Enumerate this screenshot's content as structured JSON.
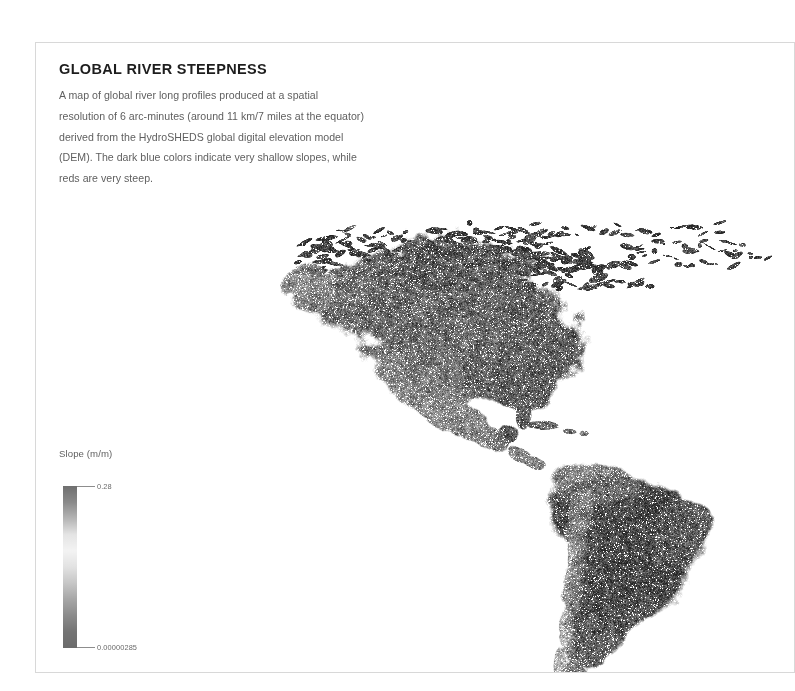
{
  "card": {
    "title": "GLOBAL RIVER STEEPNESS",
    "description": "A map of global river long profiles produced at a spatial resolution of 6 arc-minutes (around 11 km/7 miles at the equator) derived from the HydroSHEDS global digital elevation model (DEM). The dark blue colors indicate very shallow slopes, while reds are very steep.",
    "border_color": "#d8d8d8",
    "background_color": "#ffffff",
    "title_color": "#1d1d1d",
    "text_color": "#5f5f5f"
  },
  "legend": {
    "title": "Slope (m/m)",
    "max_label": "0.28",
    "min_label": "0.00000285",
    "orientation": "vertical",
    "gradient_stops": [
      "#6f6f6f",
      "#8a8a8a",
      "#b4b4b4",
      "#e4e4e4",
      "#f3f3f3",
      "#e2e2e2",
      "#c6c6c6",
      "#a6a6a6",
      "#8b8b8b",
      "#747474",
      "#6b6b6b"
    ],
    "tick_color": "#8d8d8d",
    "label_color": "#6a6a6a"
  },
  "map": {
    "region": "Americas",
    "projection": "equirectangular",
    "land_color_dark": "#4a4a4a",
    "land_color_light": "#c9c9c9",
    "ocean_color": "#ffffff",
    "raster_description": "River long-profile slope raster covering North America, Central America, the Caribbean, the Canadian Arctic Archipelago and South America"
  }
}
